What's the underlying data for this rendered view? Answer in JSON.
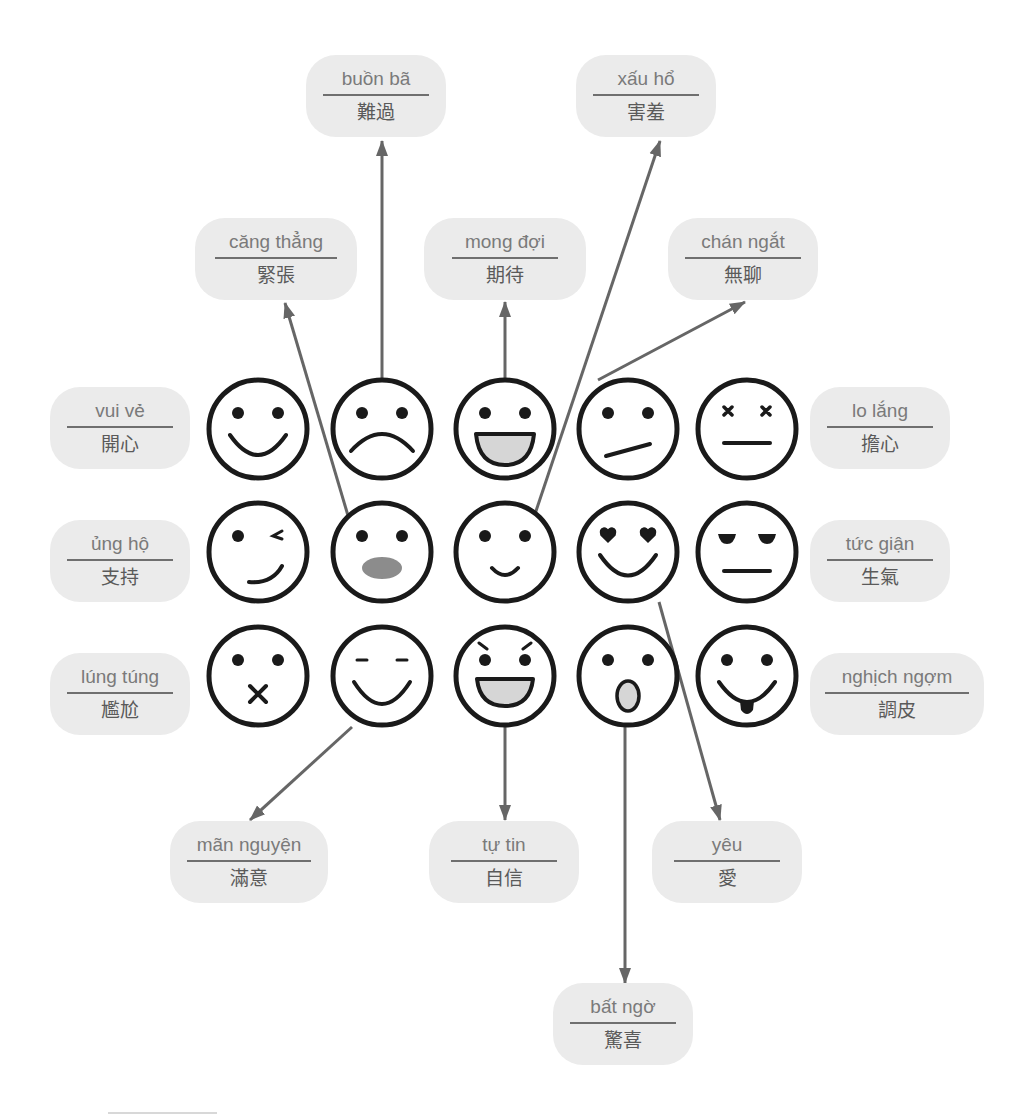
{
  "diagram": {
    "type": "emotion-vocabulary-map",
    "colors": {
      "label_fill": "#ebebeb",
      "label_text_vi": "#7a7a7a",
      "label_text_zh": "#5a5a5a",
      "arrow": "#666666",
      "face_stroke": "#1a1a1a",
      "mouth_fill": "#d6d6d6",
      "open_mouth_fill": "#8c8c8c"
    },
    "faces": [
      {
        "id": "happy",
        "row": 0,
        "col": 0,
        "icon": "smile-face-icon"
      },
      {
        "id": "sad",
        "row": 0,
        "col": 1,
        "icon": "frown-face-icon"
      },
      {
        "id": "expectant",
        "row": 0,
        "col": 2,
        "icon": "grin-face-icon"
      },
      {
        "id": "bored",
        "row": 0,
        "col": 3,
        "icon": "skewed-mouth-face-icon"
      },
      {
        "id": "worried",
        "row": 0,
        "col": 4,
        "icon": "x-eyes-face-icon"
      },
      {
        "id": "supportive",
        "row": 1,
        "col": 0,
        "icon": "wink-face-icon"
      },
      {
        "id": "nervous",
        "row": 1,
        "col": 1,
        "icon": "open-oval-mouth-face-icon"
      },
      {
        "id": "shy",
        "row": 1,
        "col": 2,
        "icon": "small-smile-face-icon"
      },
      {
        "id": "love",
        "row": 1,
        "col": 3,
        "icon": "heart-eyes-face-icon"
      },
      {
        "id": "angry",
        "row": 1,
        "col": 4,
        "icon": "half-closed-eyes-face-icon"
      },
      {
        "id": "embarrassed",
        "row": 2,
        "col": 0,
        "icon": "x-mouth-face-icon"
      },
      {
        "id": "satisfied",
        "row": 2,
        "col": 1,
        "icon": "closed-eyes-smile-face-icon"
      },
      {
        "id": "confident",
        "row": 2,
        "col": 2,
        "icon": "determined-grin-face-icon"
      },
      {
        "id": "surprised",
        "row": 2,
        "col": 3,
        "icon": "surprised-face-icon"
      },
      {
        "id": "naughty",
        "row": 2,
        "col": 4,
        "icon": "tongue-out-face-icon"
      }
    ],
    "labels": {
      "buon_ba": {
        "vi": "buồn bã",
        "zh": "難過"
      },
      "xau_ho": {
        "vi": "xấu hổ",
        "zh": "害羞"
      },
      "cang_thang": {
        "vi": "căng thẳng",
        "zh": "緊張"
      },
      "mong_doi": {
        "vi": "mong đợi",
        "zh": "期待"
      },
      "chan_ngat": {
        "vi": "chán ngắt",
        "zh": "無聊"
      },
      "vui_ve": {
        "vi": "vui vẻ",
        "zh": "開心"
      },
      "lo_lang": {
        "vi": "lo lắng",
        "zh": "擔心"
      },
      "ung_ho": {
        "vi": "ủng hộ",
        "zh": "支持"
      },
      "tuc_gian": {
        "vi": "tức giận",
        "zh": "生氣"
      },
      "lung_tung": {
        "vi": "lúng túng",
        "zh": "尷尬"
      },
      "nghich_ngom": {
        "vi": "nghịch ngợm",
        "zh": "調皮"
      },
      "man_nguyen": {
        "vi": "mãn nguyện",
        "zh": "滿意"
      },
      "tu_tin": {
        "vi": "tự tin",
        "zh": "自信"
      },
      "yeu": {
        "vi": "yêu",
        "zh": "愛"
      },
      "bat_ngo": {
        "vi": "bất ngờ",
        "zh": "驚喜"
      }
    }
  }
}
